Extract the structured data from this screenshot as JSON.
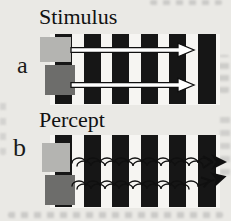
{
  "figure": {
    "panels": [
      {
        "id": "a",
        "label": "a",
        "title": "Stimulus",
        "arrow_style": "straight"
      },
      {
        "id": "b",
        "label": "b",
        "title": "Percept",
        "arrow_style": "wavy"
      }
    ],
    "grating": {
      "bar_count": 6
    },
    "colors": {
      "background": "#eae9e5",
      "bar": "#161616",
      "square_light": "#b4b4b1",
      "square_dark": "#6d6d6b",
      "arrow_outline": "#101010",
      "arrow_fill": "#ffffff",
      "text": "#111111"
    }
  }
}
